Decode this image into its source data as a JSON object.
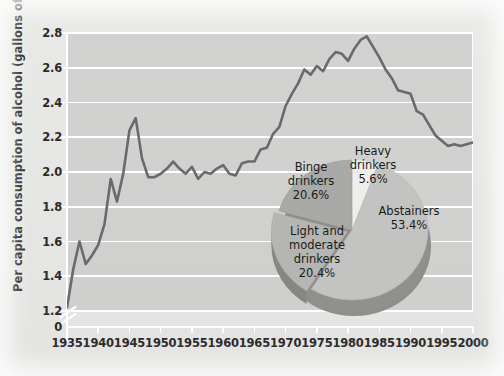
{
  "chart_data": {
    "type": "line",
    "title": "",
    "xlabel": "",
    "ylabel": "Per capita consumption of alcohol (gallons of ethanol)",
    "xlim": [
      1935,
      2000
    ],
    "ylim": [
      1.2,
      2.8
    ],
    "y_axis_break": true,
    "y_break_label": "0",
    "grid": true,
    "legend": "none",
    "yticks": [
      "2.8",
      "2.6",
      "2.4",
      "2.2",
      "2.0",
      "1.8",
      "1.6",
      "1.4",
      "1.2"
    ],
    "ytick_values": [
      2.8,
      2.6,
      2.4,
      2.2,
      2.0,
      1.8,
      1.6,
      1.4,
      1.2
    ],
    "xticks": [
      "1935",
      "1940",
      "1945",
      "1950",
      "1955",
      "1960",
      "1965",
      "1970",
      "1975",
      "1980",
      "1985",
      "1990",
      "1995",
      "2000"
    ],
    "xtick_values": [
      1935,
      1940,
      1945,
      1950,
      1955,
      1960,
      1965,
      1970,
      1975,
      1980,
      1985,
      1990,
      1995,
      2000
    ],
    "series": [
      {
        "name": "Per capita consumption of alcohol",
        "x": [
          1935,
          1936,
          1937,
          1938,
          1939,
          1940,
          1941,
          1942,
          1943,
          1944,
          1945,
          1946,
          1947,
          1948,
          1949,
          1950,
          1951,
          1952,
          1953,
          1954,
          1955,
          1956,
          1957,
          1958,
          1959,
          1960,
          1961,
          1962,
          1963,
          1964,
          1965,
          1966,
          1967,
          1968,
          1969,
          1970,
          1971,
          1972,
          1973,
          1974,
          1975,
          1976,
          1977,
          1978,
          1979,
          1980,
          1981,
          1982,
          1983,
          1984,
          1985,
          1986,
          1987,
          1988,
          1989,
          1990,
          1991,
          1992,
          1993,
          1994,
          1995,
          1996,
          1997,
          1998,
          1999,
          2000
        ],
        "values": [
          1.22,
          1.44,
          1.6,
          1.47,
          1.52,
          1.58,
          1.7,
          1.96,
          1.83,
          1.99,
          2.24,
          2.31,
          2.08,
          1.97,
          1.97,
          1.99,
          2.02,
          2.06,
          2.02,
          1.99,
          2.03,
          1.96,
          2.0,
          1.99,
          2.02,
          2.04,
          1.99,
          1.98,
          2.05,
          2.06,
          2.06,
          2.13,
          2.14,
          2.22,
          2.26,
          2.38,
          2.45,
          2.51,
          2.59,
          2.56,
          2.61,
          2.58,
          2.65,
          2.69,
          2.68,
          2.64,
          2.71,
          2.76,
          2.78,
          2.72,
          2.66,
          2.59,
          2.54,
          2.47,
          2.46,
          2.45,
          2.35,
          2.33,
          2.27,
          2.21,
          2.18,
          2.15,
          2.16,
          2.15,
          2.16,
          2.17
        ]
      }
    ],
    "inset_pie": {
      "type": "pie",
      "title": "",
      "labels": [
        "Abstainers",
        "Light and moderate drinkers",
        "Binge drinkers",
        "Heavy drinkers"
      ],
      "values": [
        53.4,
        20.4,
        20.6,
        5.6
      ],
      "value_labels": [
        "53.4%",
        "20.4%",
        "20.6%",
        "5.6%"
      ],
      "slice_label_lines": [
        [
          "Abstainers",
          "53.4%"
        ],
        [
          "Light and",
          "moderate",
          "drinkers",
          "20.4%"
        ],
        [
          "Binge",
          "drinkers",
          "20.6%"
        ],
        [
          "Heavy",
          "drinkers",
          "5.6%"
        ]
      ],
      "colors": [
        "#c3c3c1",
        "#b5b5b3",
        "#a9a9a7",
        "#eeeeec"
      ],
      "style": "3d-exploded"
    }
  },
  "colors": {
    "line": "#6a6a6a",
    "plot_background": "#d1d1cf",
    "figure_background": "#e7e7e5",
    "gridline": "#ffffff",
    "text": "#2a2a2a"
  }
}
